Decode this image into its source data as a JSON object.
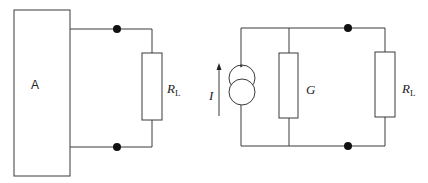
{
  "diagram": {
    "type": "circuit",
    "left_circuit": {
      "network_label": "A",
      "load": {
        "symbol": "R",
        "subscript": "L"
      },
      "terminals": 2
    },
    "right_circuit": {
      "source": {
        "kind": "current-source",
        "label": "I",
        "arrow_direction": "up"
      },
      "shunt": {
        "symbol": "G"
      },
      "load": {
        "symbol": "R",
        "subscript": "L"
      },
      "terminals": 2
    },
    "colors": {
      "wire": "#3a3a3a",
      "node": "#111111",
      "background": "#ffffff"
    }
  }
}
